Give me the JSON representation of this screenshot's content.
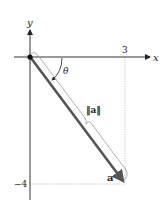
{
  "diagram": {
    "axes": {
      "x_label": "x",
      "y_label": "y"
    },
    "ticks": {
      "x_value": "3",
      "y_value": "−4"
    },
    "vector": {
      "label": "a",
      "components": [
        3,
        -4
      ],
      "magnitude_label": "‖a‖",
      "angle_label": "θ"
    },
    "colors": {
      "axis": "#333333",
      "vector": "#555555",
      "guide": "#bbbbbb",
      "bracket": "#999999"
    }
  }
}
